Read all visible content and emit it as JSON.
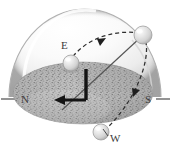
{
  "figure": {
    "type": "astronomy-horizon-diagram",
    "width": 171,
    "height": 151,
    "background_color": "#ffffff"
  },
  "dome": {
    "name": "celestial-hemisphere",
    "fill_color": "#f2f2f2",
    "edge_color": "#b8b8b8",
    "highlight_color": "#ffffff",
    "shadow_color": "#c9c9c9",
    "center_x": 85,
    "base_y": 97,
    "radius_x": 76,
    "radius_y": 88
  },
  "ground": {
    "name": "horizon-plane",
    "fill_color": "#b0b0b0",
    "speckle_color": "#6e6e6e",
    "center_x": 83,
    "center_y": 93,
    "radius_x": 70,
    "radius_y": 31
  },
  "axis": {
    "name": "north-south-axis",
    "color": "#3b3b3b",
    "left_tick_x": 2,
    "right_tick_x": 169,
    "y": 98
  },
  "cardinals": [
    {
      "id": "north",
      "label": "N",
      "x": 21,
      "y": 94,
      "color": "#3b3b3b"
    },
    {
      "id": "east",
      "label": "E",
      "x": 61,
      "y": 40,
      "color": "#3b3b3b"
    },
    {
      "id": "south",
      "label": "S",
      "x": 145,
      "y": 94,
      "color": "#3b3b3b"
    },
    {
      "id": "west",
      "label": "W",
      "x": 110,
      "y": 133,
      "color": "#3b3b3b"
    }
  ],
  "spheres": [
    {
      "id": "sun-east-horizon",
      "label": "",
      "cx": 71,
      "cy": 63,
      "r": 8,
      "fill_color": "#dcdcdc",
      "edge_color": "#9a9a9a"
    },
    {
      "id": "sun-upper-right",
      "label": "",
      "cx": 143,
      "cy": 35,
      "r": 9,
      "fill_color": "#dcdcdc",
      "edge_color": "#9a9a9a"
    },
    {
      "id": "sun-west-bottom",
      "label": "",
      "cx": 101,
      "cy": 132,
      "r": 8,
      "fill_color": "#dcdcdc",
      "edge_color": "#9a9a9a"
    }
  ],
  "paths": [
    {
      "id": "diurnal-arc-upper",
      "style": "dashed",
      "color": "#2e2e2e",
      "arrow": "mid-right",
      "description": "dashed arc from east sphere rising toward upper-right sphere"
    },
    {
      "id": "diurnal-arc-lower",
      "style": "dashed",
      "color": "#2e2e2e",
      "arrow": "mid-down",
      "description": "dashed arc descending from upper-right sphere toward west sphere"
    },
    {
      "id": "zenith-sight-line",
      "style": "solid",
      "color": "#4a4a4a",
      "description": "straight sight line from horizon centre to upper-right sphere"
    }
  ],
  "angle_marker": {
    "id": "altitude-right-angle",
    "color": "#1a1a1a",
    "vertical_x": 86,
    "vertical_top_y": 68,
    "vertical_bottom_y": 100,
    "horizontal_y": 100,
    "horizontal_left_x": 58,
    "arrow_direction": "left-toward-north",
    "line_width": 3
  }
}
